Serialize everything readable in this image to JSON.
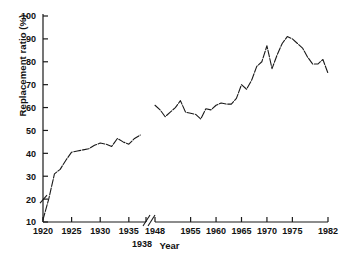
{
  "chart_data": {
    "type": "line",
    "title": "",
    "xlabel": "Year",
    "ylabel": "Replacement ratio (%)",
    "ylim": [
      10,
      100
    ],
    "ytick_values": [
      10,
      20,
      30,
      40,
      50,
      60,
      70,
      80,
      90,
      100
    ],
    "ytick_labels": [
      "10",
      "20",
      "30",
      "40",
      "50",
      "60",
      "70",
      "80",
      "90",
      "100"
    ],
    "xtick_labels": [
      "1920",
      "1925",
      "1930",
      "1935",
      "1948",
      "1955",
      "1960",
      "1965",
      "1970",
      "1975",
      "1982"
    ],
    "xtick_values": [
      1920,
      1925,
      1930,
      1935,
      1948,
      1955,
      1960,
      1965,
      1970,
      1975,
      1982
    ],
    "offset_xtick_label": "1938",
    "offset_xtick_value": 1938,
    "axis_break": {
      "from": 1938,
      "to": 1948,
      "label": "axis-break-marker"
    },
    "grid": false,
    "legend": "none",
    "line_color": "#1a1a1a",
    "series": [
      {
        "name": "Pre-war replacement ratio",
        "x": [
          1920,
          1921,
          1922,
          1923,
          1924,
          1925,
          1926,
          1927,
          1928,
          1929,
          1930,
          1931,
          1932,
          1933,
          1934,
          1935,
          1936,
          1937
        ],
        "values": [
          11,
          20,
          31,
          33,
          37,
          40.5,
          41,
          41.5,
          42,
          43.5,
          44.5,
          44,
          43,
          46.5,
          45,
          44,
          46.5,
          48
        ]
      },
      {
        "name": "Post-war replacement ratio",
        "x": [
          1948,
          1949,
          1950,
          1951,
          1952,
          1953,
          1954,
          1955,
          1956,
          1957,
          1958,
          1959,
          1960,
          1961,
          1962,
          1963,
          1964,
          1965,
          1966,
          1967,
          1968,
          1969,
          1970,
          1971,
          1972,
          1973,
          1974,
          1975,
          1976,
          1977,
          1978,
          1979,
          1980,
          1981,
          1982
        ],
        "values": [
          61,
          59,
          56,
          58,
          60,
          63,
          58,
          57.5,
          57,
          55,
          59.5,
          59,
          61,
          62,
          61.5,
          61.5,
          64,
          70,
          68,
          72,
          78,
          80,
          87,
          77,
          83,
          88,
          91,
          90,
          88,
          86,
          82,
          79,
          79,
          81,
          75
        ]
      }
    ]
  },
  "axis": {
    "y_axis_name": "y-axis",
    "x_axis_name": "x-axis"
  }
}
